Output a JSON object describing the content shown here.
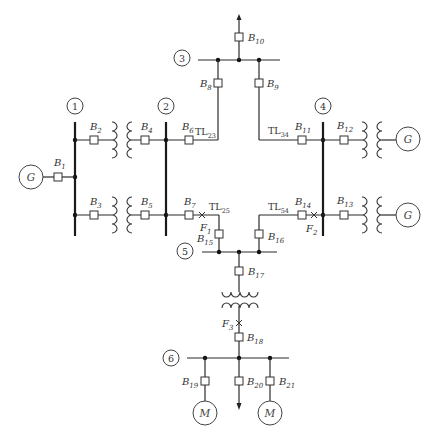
{
  "diagram": {
    "type": "single-line power system diagram",
    "buses": [
      {
        "id": "1",
        "label": "1"
      },
      {
        "id": "2",
        "label": "2"
      },
      {
        "id": "3",
        "label": "3"
      },
      {
        "id": "4",
        "label": "4"
      },
      {
        "id": "5",
        "label": "5"
      },
      {
        "id": "6",
        "label": "6"
      }
    ],
    "breakers": {
      "B1": {
        "base": "B",
        "sub": "1"
      },
      "B2": {
        "base": "B",
        "sub": "2"
      },
      "B3": {
        "base": "B",
        "sub": "3"
      },
      "B4": {
        "base": "B",
        "sub": "4"
      },
      "B5": {
        "base": "B",
        "sub": "5"
      },
      "B6": {
        "base": "B",
        "sub": "6"
      },
      "B7": {
        "base": "B",
        "sub": "7"
      },
      "B8": {
        "base": "B",
        "sub": "8"
      },
      "B9": {
        "base": "B",
        "sub": "9"
      },
      "B10": {
        "base": "B",
        "sub": "10"
      },
      "B11": {
        "base": "B",
        "sub": "11"
      },
      "B12": {
        "base": "B",
        "sub": "12"
      },
      "B13": {
        "base": "B",
        "sub": "13"
      },
      "B14": {
        "base": "B",
        "sub": "14"
      },
      "B15": {
        "base": "B",
        "sub": "15"
      },
      "B16": {
        "base": "B",
        "sub": "16"
      },
      "B17": {
        "base": "B",
        "sub": "17"
      },
      "B18": {
        "base": "B",
        "sub": "18"
      },
      "B19": {
        "base": "B",
        "sub": "19"
      },
      "B20": {
        "base": "B",
        "sub": "20"
      },
      "B21": {
        "base": "B",
        "sub": "21"
      }
    },
    "lines": {
      "TL23": {
        "base": "TL",
        "sub": "23"
      },
      "TL34": {
        "base": "TL",
        "sub": "34"
      },
      "TL25": {
        "base": "TL",
        "sub": "25"
      },
      "TL54": {
        "base": "TL",
        "sub": "54"
      }
    },
    "faults": {
      "F1": {
        "base": "F",
        "sub": "1"
      },
      "F2": {
        "base": "F",
        "sub": "2"
      },
      "F3": {
        "base": "F",
        "sub": "3"
      }
    },
    "machines": {
      "gen_bus1": "G",
      "gen_bus4_upper": "G",
      "gen_bus4_lower": "G",
      "motor_left": "M",
      "motor_right": "M"
    },
    "icons": {
      "breaker": "breaker-icon",
      "transformer": "transformer-icon",
      "generator": "generator-icon",
      "motor": "motor-icon",
      "load": "load-arrow-icon",
      "fault": "fault-x-icon",
      "node": "junction-dot-icon"
    }
  }
}
